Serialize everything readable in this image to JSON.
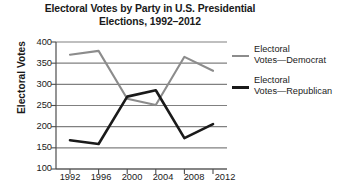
{
  "chart_data": {
    "type": "line",
    "title": "Electoral Votes by Party in U.S. Presidential Elections, 1992–2012",
    "title_line1": "Electoral Votes by Party in U.S. Presidential",
    "title_line2": "Elections, 1992–2012",
    "xlabel": "",
    "ylabel": "Electoral Votes",
    "categories": [
      "1992",
      "1996",
      "2000",
      "2004",
      "2008",
      "2012"
    ],
    "x": [
      1992,
      1996,
      2000,
      2004,
      2008,
      2012
    ],
    "ylim": [
      100,
      400
    ],
    "yticks": [
      "400",
      "350",
      "300",
      "250",
      "200",
      "150",
      "100"
    ],
    "ytick_values": [
      400,
      350,
      300,
      250,
      200,
      150,
      100
    ],
    "grid": true,
    "grid_axis": "y",
    "legend_position": "right",
    "series": [
      {
        "name": "Electoral Votes—Democrat",
        "name_line1": "Electoral",
        "name_line2": "Votes—Democrat",
        "color": "#8c8c8c",
        "values": [
          370,
          379,
          266,
          251,
          365,
          332
        ]
      },
      {
        "name": "Electoral Votes—Republican",
        "name_line1": "Electoral",
        "name_line2": "Votes—Republican",
        "color": "#1a1a1a",
        "values": [
          168,
          159,
          271,
          286,
          173,
          206
        ]
      }
    ]
  },
  "colors": {
    "democrat": "#8c8c8c",
    "republican": "#1a1a1a",
    "gridline": "#808080",
    "axis": "#4d4d4d",
    "text": "#1a1a1a",
    "background": "#ffffff"
  }
}
